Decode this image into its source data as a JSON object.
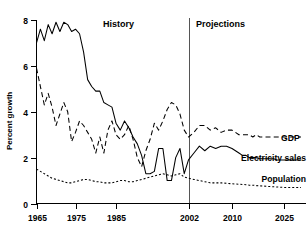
{
  "chart_data": {
    "type": "line",
    "title": "",
    "xlabel": "",
    "ylabel": "Percent growth",
    "xlim": [
      1965,
      2027
    ],
    "ylim": [
      0,
      8
    ],
    "yticks": [
      0,
      2,
      4,
      6,
      8
    ],
    "ytick_labels": [
      "0",
      "2",
      "4",
      "6",
      "8"
    ],
    "xticks": [
      1965,
      1975,
      1985,
      2002,
      2010,
      2025
    ],
    "xtick_labels": [
      "1965",
      "1975",
      "1985",
      "2002",
      "2010",
      "2025"
    ],
    "grid": false,
    "legend_position": "right-inline",
    "annotations": [
      {
        "text": "History",
        "x": 1988,
        "y": 7.7
      },
      {
        "text": "Projections",
        "x": 2011,
        "y": 7.7
      }
    ],
    "divider": {
      "x": 2002,
      "label": "history-projection-divider"
    },
    "series": [
      {
        "name": "GDP",
        "style": "dashed",
        "x": [
          1965,
          1966,
          1967,
          1968,
          1969,
          1970,
          1971,
          1972,
          1973,
          1974,
          1975,
          1976,
          1977,
          1978,
          1979,
          1980,
          1981,
          1982,
          1983,
          1984,
          1985,
          1986,
          1987,
          1988,
          1989,
          1990,
          1991,
          1992,
          1993,
          1994,
          1995,
          1996,
          1997,
          1998,
          1999,
          2000,
          2001,
          2002,
          2003,
          2004,
          2005,
          2006,
          2007,
          2008,
          2009,
          2010,
          2011,
          2012,
          2013,
          2014,
          2015,
          2016,
          2017,
          2018,
          2019,
          2020,
          2021,
          2022,
          2023,
          2024,
          2025,
          2026,
          2027
        ],
        "values": [
          5.9,
          5.1,
          4.3,
          4.8,
          4.2,
          3.4,
          3.9,
          4.4,
          4.0,
          2.7,
          3.1,
          3.6,
          3.4,
          3.1,
          2.8,
          2.2,
          2.9,
          2.2,
          3.2,
          3.6,
          3.0,
          2.8,
          3.0,
          3.4,
          2.8,
          2.0,
          1.6,
          2.3,
          2.8,
          3.5,
          3.2,
          3.6,
          4.1,
          4.4,
          4.3,
          3.9,
          3.2,
          2.9,
          3.1,
          3.4,
          3.4,
          3.2,
          3.3,
          3.1,
          3.2,
          3.2,
          3.1,
          3.0,
          3.0,
          3.0,
          3.0,
          2.9,
          3.0,
          2.9,
          2.9,
          2.9,
          2.9,
          2.9,
          2.9,
          2.9,
          2.9,
          2.9,
          2.9
        ]
      },
      {
        "name": "Electricity sales",
        "style": "solid",
        "x": [
          1965,
          1966,
          1967,
          1968,
          1969,
          1970,
          1971,
          1972,
          1973,
          1974,
          1975,
          1976,
          1977,
          1978,
          1979,
          1980,
          1981,
          1982,
          1983,
          1984,
          1985,
          1986,
          1987,
          1988,
          1989,
          1990,
          1991,
          1992,
          1993,
          1994,
          1995,
          1996,
          1997,
          1998,
          1999,
          2000,
          2001,
          2002,
          2003,
          2004,
          2005,
          2006,
          2007,
          2008,
          2009,
          2010,
          2011,
          2012,
          2013,
          2014,
          2015,
          2016,
          2017,
          2018,
          2019,
          2020,
          2021,
          2022,
          2023,
          2024,
          2025,
          2026,
          2027
        ],
        "values": [
          7.0,
          7.6,
          7.1,
          7.8,
          7.4,
          7.9,
          7.5,
          7.9,
          7.8,
          7.5,
          7.6,
          7.4,
          6.6,
          5.4,
          5.1,
          4.9,
          4.9,
          4.4,
          4.3,
          4.2,
          3.5,
          3.2,
          3.6,
          3.3,
          2.9,
          2.6,
          2.1,
          1.3,
          1.3,
          1.4,
          2.4,
          2.4,
          1.0,
          1.0,
          2.0,
          2.4,
          1.3,
          1.9,
          2.2,
          2.5,
          2.3,
          2.5,
          2.4,
          2.5,
          2.5,
          2.4,
          2.3,
          2.2,
          2.1,
          2.1,
          2.0,
          2.0,
          2.0,
          1.95,
          1.95,
          1.95,
          1.95,
          1.95,
          1.9,
          1.9,
          1.9,
          1.9,
          1.9
        ]
      },
      {
        "name": "Population",
        "style": "dotted",
        "x": [
          1965,
          1966,
          1967,
          1968,
          1969,
          1970,
          1971,
          1972,
          1973,
          1974,
          1975,
          1976,
          1977,
          1978,
          1979,
          1980,
          1981,
          1982,
          1983,
          1984,
          1985,
          1986,
          1987,
          1988,
          1989,
          1990,
          1991,
          1992,
          1993,
          1994,
          1995,
          1996,
          1997,
          1998,
          1999,
          2000,
          2001,
          2002,
          2003,
          2004,
          2005,
          2006,
          2007,
          2008,
          2009,
          2010,
          2011,
          2012,
          2013,
          2014,
          2015,
          2016,
          2017,
          2018,
          2019,
          2020,
          2021,
          2022,
          2023,
          2024,
          2025,
          2026,
          2027
        ],
        "values": [
          1.5,
          1.4,
          1.3,
          1.2,
          1.1,
          1.05,
          1.0,
          0.95,
          0.9,
          0.9,
          0.95,
          1.0,
          1.05,
          1.05,
          1.0,
          0.95,
          0.95,
          0.9,
          0.9,
          0.9,
          0.95,
          1.0,
          1.0,
          0.95,
          0.95,
          1.0,
          1.05,
          1.1,
          1.15,
          1.2,
          1.25,
          1.3,
          1.25,
          1.2,
          1.25,
          1.3,
          1.15,
          1.1,
          1.05,
          1.0,
          0.95,
          0.9,
          0.9,
          0.9,
          0.88,
          0.86,
          0.85,
          0.84,
          0.83,
          0.82,
          0.8,
          0.8,
          0.78,
          0.77,
          0.76,
          0.75,
          0.74,
          0.73,
          0.72,
          0.71,
          0.7,
          0.7,
          0.7
        ]
      }
    ]
  },
  "axis": {
    "y_title": "Percent growth"
  },
  "labels": {
    "history": "History",
    "projections": "Projections",
    "gdp": "GDP",
    "electricity_sales": "Electricity sales",
    "population": "Population"
  }
}
